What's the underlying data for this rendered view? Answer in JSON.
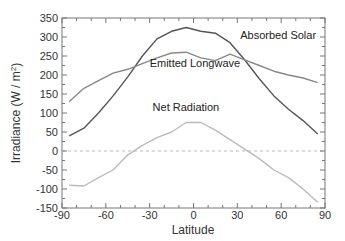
{
  "chart_data": {
    "type": "line",
    "title": "",
    "xlabel": "Latitude",
    "ylabel": "Irradiance (W / m²)",
    "xlim": [
      -90,
      90
    ],
    "ylim": [
      -150,
      350
    ],
    "xticks": [
      -90,
      -60,
      -30,
      0,
      30,
      60,
      90
    ],
    "yticks": [
      -150,
      -100,
      -50,
      0,
      50,
      100,
      150,
      200,
      250,
      300,
      350
    ],
    "grid": false,
    "zero_line": {
      "y": 0,
      "style": "dashed",
      "color": "#bbbbbb"
    },
    "series": [
      {
        "name": "Absorbed Solar",
        "color": "#555555",
        "x": [
          -85,
          -75,
          -65,
          -55,
          -45,
          -35,
          -25,
          -15,
          -5,
          5,
          15,
          25,
          35,
          45,
          55,
          65,
          75,
          85
        ],
        "y": [
          40,
          60,
          100,
          145,
          195,
          250,
          295,
          315,
          325,
          315,
          310,
          285,
          240,
          190,
          145,
          110,
          80,
          45
        ]
      },
      {
        "name": "Emitted Longwave",
        "color": "#888888",
        "x": [
          -85,
          -75,
          -65,
          -55,
          -45,
          -35,
          -25,
          -15,
          -5,
          5,
          15,
          25,
          35,
          45,
          55,
          65,
          75,
          85
        ],
        "y": [
          130,
          165,
          185,
          205,
          215,
          230,
          245,
          258,
          260,
          245,
          238,
          255,
          240,
          225,
          210,
          200,
          192,
          180
        ]
      },
      {
        "name": "Net Radiation",
        "color": "#bbbbbb",
        "x": [
          -85,
          -75,
          -65,
          -55,
          -45,
          -35,
          -25,
          -15,
          -5,
          5,
          15,
          25,
          35,
          45,
          55,
          65,
          75,
          85
        ],
        "y": [
          -90,
          -92,
          -70,
          -50,
          -10,
          15,
          35,
          50,
          75,
          75,
          55,
          30,
          5,
          -20,
          -50,
          -70,
          -100,
          -135
        ]
      }
    ],
    "annotations": [
      {
        "text": "Absorbed Solar",
        "x": 32,
        "y": 295
      },
      {
        "text": "Emitted Longwave",
        "x": -30,
        "y": 220
      },
      {
        "text": "Net Radiation",
        "x": -28,
        "y": 105
      }
    ]
  }
}
